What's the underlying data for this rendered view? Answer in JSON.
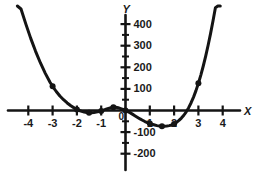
{
  "chart_data": {
    "type": "line",
    "title": "",
    "subtitle": "",
    "xlabel": "X",
    "ylabel": "Y",
    "xlim": [
      -4.75,
      4.6
    ],
    "ylim": [
      -240,
      460
    ],
    "grid": false,
    "legend": null,
    "x_ticks": [
      -4,
      -3,
      -2,
      -1,
      1,
      2,
      3,
      4
    ],
    "x_tick_labels": [
      "-4",
      "-3",
      "-2",
      "-1",
      "1",
      "2",
      "3",
      "4"
    ],
    "y_ticks": [
      -200,
      -100,
      100,
      200,
      300,
      400
    ],
    "y_tick_labels": [
      "-200",
      "-100",
      "100",
      "200",
      "300",
      "400"
    ],
    "y_minor_ticks": [
      -150,
      -50,
      50,
      150,
      250,
      350
    ],
    "origin_label": "0",
    "curve": {
      "name": "polynomial",
      "x": [
        -4.45,
        -4.3,
        -4.1,
        -3.9,
        -3.7,
        -3.5,
        -3.3,
        -3.1,
        -3.0,
        -2.85,
        -2.7,
        -2.55,
        -2.4,
        -2.25,
        -2.1,
        -2.0,
        -1.9,
        -1.8,
        -1.7,
        -1.6,
        -1.5,
        -1.4,
        -1.3,
        -1.2,
        -1.1,
        -1.0,
        -0.9,
        -0.8,
        -0.7,
        -0.6,
        -0.5,
        -0.4,
        -0.3,
        -0.2,
        -0.1,
        0.0,
        0.1,
        0.2,
        0.3,
        0.4,
        0.5,
        0.6,
        0.7,
        0.8,
        0.9,
        1.0,
        1.1,
        1.2,
        1.3,
        1.4,
        1.5,
        1.6,
        1.7,
        1.8,
        1.9,
        2.0,
        2.1,
        2.2,
        2.3,
        2.4,
        2.5,
        2.6,
        2.7,
        2.8,
        2.9,
        3.0,
        3.1,
        3.2,
        3.3,
        3.4,
        3.5,
        3.6,
        3.7,
        3.8,
        3.9,
        4.0,
        4.1,
        4.2,
        4.3,
        4.4
      ],
      "y": [
        530,
        470,
        400,
        334,
        274,
        220,
        172,
        130,
        112,
        88,
        67,
        50,
        35,
        22,
        11,
        5,
        0,
        -4,
        -7,
        -9,
        -10,
        -10,
        -9,
        -7,
        -5,
        -2,
        2,
        6,
        10,
        13,
        15,
        15,
        13,
        9,
        5,
        0,
        -5,
        -11,
        -18,
        -25,
        -32,
        -39,
        -45,
        -51,
        -56,
        -60,
        -64,
        -67,
        -70,
        -72,
        -73,
        -73,
        -72,
        -70,
        -67,
        -62,
        -55,
        -46,
        -35,
        -22,
        -6,
        13,
        36,
        62,
        92,
        126,
        164,
        206,
        252,
        302,
        356,
        414,
        476,
        542,
        612,
        686,
        764,
        846,
        932,
        1022
      ]
    },
    "points": [
      {
        "x": -3.0,
        "y": 112
      },
      {
        "x": -2.0,
        "y": 5
      },
      {
        "x": -1.5,
        "y": -10
      },
      {
        "x": -1.0,
        "y": -2
      },
      {
        "x": -0.5,
        "y": 15
      },
      {
        "x": 0.0,
        "y": 0
      },
      {
        "x": 1.0,
        "y": -60
      },
      {
        "x": 1.5,
        "y": -73
      },
      {
        "x": 2.0,
        "y": -62
      },
      {
        "x": 3.0,
        "y": 126
      },
      {
        "x": 4.0,
        "y": 686
      }
    ]
  }
}
